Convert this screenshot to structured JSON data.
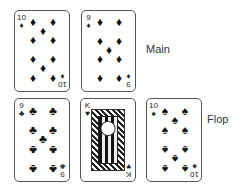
{
  "labels": {
    "main": "Main",
    "flop": "Flop"
  },
  "main": [
    {
      "rank": "10",
      "suit": "♦",
      "suit_name": "diamonds"
    },
    {
      "rank": "9",
      "suit": "♦",
      "suit_name": "diamonds"
    }
  ],
  "flop": [
    {
      "rank": "9",
      "suit": "♣",
      "suit_name": "clubs"
    },
    {
      "rank": "K",
      "suit": "♥",
      "suit_name": "hearts"
    },
    {
      "rank": "10",
      "suit": "♠",
      "suit_name": "spades"
    }
  ],
  "colors": {
    "border": "#555555",
    "ink": "#111111",
    "background": "#ffffff"
  }
}
